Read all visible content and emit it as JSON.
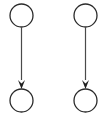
{
  "canvas": {
    "width": 110,
    "height": 118,
    "background_color": "#ffffff"
  },
  "style": {
    "node_stroke_color": "#2b2b2b",
    "node_stroke_width": 1.3,
    "node_fill": "none",
    "edge_stroke_color": "#4a4a4a",
    "edge_stroke_width": 1.2,
    "arrowhead_fill_color": "#1f1f1f",
    "arrowhead_width": 7,
    "arrowhead_height": 9
  },
  "diagram": {
    "type": "directed-graph",
    "node_radius": 11.5,
    "groups": [
      {
        "id": "group-left",
        "nodes": [
          {
            "id": "left-top-node",
            "cx": 21.5,
            "cy": 15.5,
            "r": 11.5,
            "label": ""
          },
          {
            "id": "left-bottom-node",
            "cx": 21.5,
            "cy": 100.5,
            "r": 11.5,
            "label": ""
          }
        ],
        "edges": [
          {
            "id": "left-edge",
            "from": "left-top-node",
            "to": "left-bottom-node",
            "x1": 21.5,
            "y1": 27.0,
            "x2": 21.5,
            "y2": 80.0,
            "tip_x": 21.5,
            "tip_y": 89.0,
            "directed": true,
            "label": ""
          }
        ]
      },
      {
        "id": "group-right",
        "nodes": [
          {
            "id": "right-top-node",
            "cx": 85.5,
            "cy": 15.5,
            "r": 11.5,
            "label": ""
          },
          {
            "id": "right-bottom-node",
            "cx": 85.5,
            "cy": 100.5,
            "r": 11.5,
            "label": ""
          }
        ],
        "edges": [
          {
            "id": "right-edge",
            "from": "right-top-node",
            "to": "right-bottom-node",
            "x1": 85.5,
            "y1": 27.0,
            "x2": 85.5,
            "y2": 80.0,
            "tip_x": 85.5,
            "tip_y": 89.0,
            "directed": true,
            "label": ""
          }
        ]
      }
    ]
  }
}
